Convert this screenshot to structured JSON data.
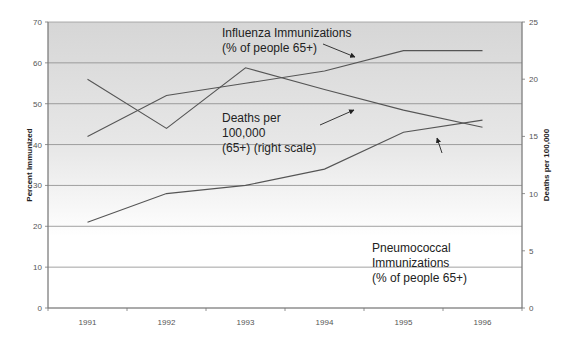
{
  "chart_data": {
    "type": "line",
    "title": "",
    "xlabel": "",
    "ylabel": "Percent Immunized",
    "y2label": "Deaths per 100,000",
    "categories": [
      "1991",
      "1992",
      "1993",
      "1994",
      "1995",
      "1996"
    ],
    "ylim": [
      0,
      70
    ],
    "y2lim": [
      0,
      25
    ],
    "yticks": [
      "0",
      "10",
      "20",
      "30",
      "40",
      "50",
      "60",
      "70"
    ],
    "y2ticks": [
      "0",
      "5",
      "10",
      "15",
      "20",
      "25"
    ],
    "grid": true,
    "legend": "none (inline annotations)",
    "series": [
      {
        "name": "Influenza Immunizations (% of people 65+)",
        "axis": "left",
        "values": [
          42,
          52,
          55,
          58,
          63,
          63
        ]
      },
      {
        "name": "Pneumococcal Immunizations (% of people 65+)",
        "axis": "left",
        "values": [
          21,
          28,
          30,
          34,
          43,
          46
        ]
      },
      {
        "name": "Deaths per 100,000 (65+) (right scale)",
        "axis": "right",
        "values": [
          20.0,
          15.7,
          21.0,
          19.1,
          17.3,
          15.8
        ]
      }
    ],
    "annotations": [
      {
        "lines": [
          "Influenza Immunizations",
          "(% of people 65+)"
        ]
      },
      {
        "lines": [
          "Deaths per",
          "100,000",
          "(65+) (right scale)"
        ]
      },
      {
        "lines": [
          "Pneumococcal",
          "Immunizations",
          "(% of people 65+)"
        ]
      }
    ]
  },
  "colors": {
    "line": "#555555",
    "grid": "#8a8a8a",
    "bg_top": "#d8d8d8",
    "bg_bottom": "#ffffff"
  }
}
